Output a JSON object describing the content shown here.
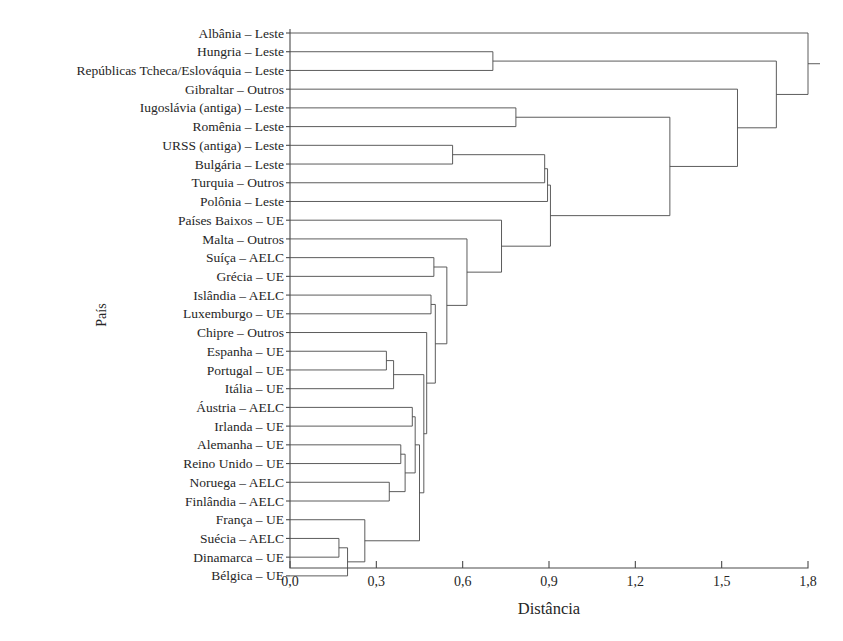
{
  "chart_data": {
    "type": "dendrogram",
    "title": "",
    "xlabel": "Distância",
    "ylabel": "País",
    "xlim": [
      0.0,
      1.8
    ],
    "xticks": [
      0.0,
      0.3,
      0.6,
      0.9,
      1.2,
      1.5,
      1.8
    ],
    "xticklabels": [
      "0,0",
      "0,3",
      "0,6",
      "0,9",
      "1,2",
      "1,5",
      "1,8"
    ],
    "grid": false,
    "legend": null,
    "orientation": "horizontal",
    "leaf_count": 29,
    "leaves": [
      {
        "index": 0,
        "label": "Albânia – Leste",
        "country": "Albânia",
        "group": "Leste"
      },
      {
        "index": 1,
        "label": "Hungria – Leste",
        "country": "Hungria",
        "group": "Leste"
      },
      {
        "index": 2,
        "label": "Repúblicas Tcheca/Eslováquia – Leste",
        "country": "Repúblicas Tcheca/Eslováquia",
        "group": "Leste"
      },
      {
        "index": 3,
        "label": "Gibraltar – Outros",
        "country": "Gibraltar",
        "group": "Outros"
      },
      {
        "index": 4,
        "label": "Iugoslávia (antiga) – Leste",
        "country": "Iugoslávia (antiga)",
        "group": "Leste"
      },
      {
        "index": 5,
        "label": "Romênia – Leste",
        "country": "Romênia",
        "group": "Leste"
      },
      {
        "index": 6,
        "label": "URSS (antiga) – Leste",
        "country": "URSS (antiga)",
        "group": "Leste"
      },
      {
        "index": 7,
        "label": "Bulgária – Leste",
        "country": "Bulgária",
        "group": "Leste"
      },
      {
        "index": 8,
        "label": "Turquia – Outros",
        "country": "Turquia",
        "group": "Outros"
      },
      {
        "index": 9,
        "label": "Polônia – Leste",
        "country": "Polônia",
        "group": "Leste"
      },
      {
        "index": 10,
        "label": "Países Baixos – UE",
        "country": "Países Baixos",
        "group": "UE"
      },
      {
        "index": 11,
        "label": "Malta – Outros",
        "country": "Malta",
        "group": "Outros"
      },
      {
        "index": 12,
        "label": "Suíça – AELC",
        "country": "Suíça",
        "group": "AELC"
      },
      {
        "index": 13,
        "label": "Grécia – UE",
        "country": "Grécia",
        "group": "UE"
      },
      {
        "index": 14,
        "label": "Islândia – AELC",
        "country": "Islândia",
        "group": "AELC"
      },
      {
        "index": 15,
        "label": "Luxemburgo – UE",
        "country": "Luxemburgo",
        "group": "UE"
      },
      {
        "index": 16,
        "label": "Chipre – Outros",
        "country": "Chipre",
        "group": "Outros"
      },
      {
        "index": 17,
        "label": "Espanha – UE",
        "country": "Espanha",
        "group": "UE"
      },
      {
        "index": 18,
        "label": "Portugal – UE",
        "country": "Portugal",
        "group": "UE"
      },
      {
        "index": 19,
        "label": "Itália – UE",
        "country": "Itália",
        "group": "UE"
      },
      {
        "index": 20,
        "label": "Áustria – AELC",
        "country": "Áustria",
        "group": "AELC"
      },
      {
        "index": 21,
        "label": "Irlanda – UE",
        "country": "Irlanda",
        "group": "UE"
      },
      {
        "index": 22,
        "label": "Alemanha – UE",
        "country": "Alemanha",
        "group": "UE"
      },
      {
        "index": 23,
        "label": "Reino Unido – UE",
        "country": "Reino Unido",
        "group": "UE"
      },
      {
        "index": 24,
        "label": "Noruega – AELC",
        "country": "Noruega",
        "group": "AELC"
      },
      {
        "index": 25,
        "label": "Finlândia – AELC",
        "country": "Finlândia",
        "group": "AELC"
      },
      {
        "index": 26,
        "label": "França – UE",
        "country": "França",
        "group": "UE"
      },
      {
        "index": 27,
        "label": "Suécia – AELC",
        "country": "Suécia",
        "group": "AELC"
      },
      {
        "index": 28,
        "label": "Dinamarca – UE",
        "country": "Dinamarca",
        "group": "UE"
      },
      {
        "index": 29,
        "label": "Bélgica – UE",
        "country": "Bélgica",
        "group": "UE"
      }
    ],
    "merges": [
      {
        "id": "m1",
        "left": "leaf:27",
        "right": "leaf:28",
        "distance": 0.17
      },
      {
        "id": "m2",
        "left": "m1",
        "right": "leaf:29",
        "distance": 0.2
      },
      {
        "id": "m3",
        "left": "leaf:17",
        "right": "leaf:18",
        "distance": 0.335
      },
      {
        "id": "m4",
        "left": "m3",
        "right": "leaf:19",
        "distance": 0.36
      },
      {
        "id": "m5",
        "left": "leaf:26",
        "right": "m2",
        "distance": 0.26
      },
      {
        "id": "m6",
        "left": "leaf:24",
        "right": "leaf:25",
        "distance": 0.345
      },
      {
        "id": "m7",
        "left": "leaf:22",
        "right": "leaf:23",
        "distance": 0.385
      },
      {
        "id": "m8",
        "left": "m7",
        "right": "m6",
        "distance": 0.4
      },
      {
        "id": "m9",
        "left": "leaf:20",
        "right": "leaf:21",
        "distance": 0.425
      },
      {
        "id": "m10",
        "left": "m9",
        "right": "m8",
        "distance": 0.435
      },
      {
        "id": "m11",
        "left": "m5",
        "right": "m10",
        "distance": 0.45
      },
      {
        "id": "m12",
        "left": "m4",
        "right": "m11",
        "distance": 0.465
      },
      {
        "id": "m13",
        "left": "leaf:16",
        "right": "m12",
        "distance": 0.475
      },
      {
        "id": "m14",
        "left": "leaf:12",
        "right": "leaf:13",
        "distance": 0.5
      },
      {
        "id": "m15",
        "left": "leaf:14",
        "right": "leaf:15",
        "distance": 0.49
      },
      {
        "id": "m16",
        "left": "m15",
        "right": "m13",
        "distance": 0.505
      },
      {
        "id": "m17",
        "left": "m14",
        "right": "m16",
        "distance": 0.545
      },
      {
        "id": "m18",
        "left": "leaf:11",
        "right": "m17",
        "distance": 0.615
      },
      {
        "id": "m19",
        "left": "leaf:10",
        "right": "m18",
        "distance": 0.735
      },
      {
        "id": "m20",
        "left": "leaf:6",
        "right": "leaf:7",
        "distance": 0.565
      },
      {
        "id": "m21",
        "left": "leaf:4",
        "right": "leaf:5",
        "distance": 0.785
      },
      {
        "id": "m22",
        "left": "m20",
        "right": "leaf:8",
        "distance": 0.885
      },
      {
        "id": "m23",
        "left": "m22",
        "right": "leaf:9",
        "distance": 0.895
      },
      {
        "id": "m24",
        "left": "m23",
        "right": "m19",
        "distance": 0.905
      },
      {
        "id": "m25",
        "left": "m21",
        "right": "m24",
        "distance": 1.32
      },
      {
        "id": "m26",
        "left": "leaf:3",
        "right": "m25",
        "distance": 1.555
      },
      {
        "id": "m27",
        "left": "leaf:1",
        "right": "leaf:2",
        "distance": 0.705
      },
      {
        "id": "m28",
        "left": "m27",
        "right": "m26",
        "distance": 1.69
      },
      {
        "id": "m29",
        "left": "leaf:0",
        "right": "m28",
        "distance": 1.8
      }
    ]
  },
  "axes": {
    "x_title": "Distância",
    "y_title": "País"
  },
  "colors": {
    "line": "#4a4a4a",
    "text": "#262626",
    "background": "#ffffff"
  }
}
